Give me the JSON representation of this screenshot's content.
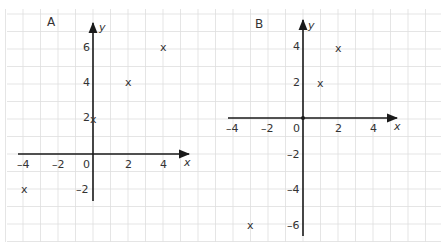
{
  "chart_data": [
    {
      "type": "scatter",
      "title": "A",
      "xlabel": "x",
      "ylabel": "y",
      "xlim": [
        -4,
        5
      ],
      "ylim": [
        -2.5,
        7
      ],
      "grid": true,
      "x_ticks": [
        "-4",
        "-2",
        "0",
        "2",
        "4"
      ],
      "y_ticks": [
        "6",
        "4",
        "2",
        "-2"
      ],
      "points": [
        {
          "x": 4,
          "y": 6
        },
        {
          "x": 2,
          "y": 4
        },
        {
          "x": 0,
          "y": 2
        },
        {
          "x": -4,
          "y": -2
        }
      ],
      "marker": "x"
    },
    {
      "type": "scatter",
      "title": "B",
      "xlabel": "x",
      "ylabel": "y",
      "xlim": [
        -4,
        5
      ],
      "ylim": [
        -6.5,
        5.5
      ],
      "grid": true,
      "x_ticks": [
        "-4",
        "-2",
        "0",
        "2",
        "4"
      ],
      "y_ticks": [
        "4",
        "2",
        "-2",
        "-4",
        "-6"
      ],
      "points": [
        {
          "x": 2,
          "y": 4
        },
        {
          "x": 1,
          "y": 2
        },
        {
          "x": 0,
          "y": 0
        },
        {
          "x": -3,
          "y": -6
        }
      ],
      "marker": "x"
    }
  ],
  "labels": {
    "graph_a_title": "A",
    "graph_b_title": "B",
    "x_axis": "x",
    "y_axis": "y",
    "marker_glyph": "x",
    "a_xticks": [
      "–4",
      "–2",
      "0",
      "2",
      "4"
    ],
    "a_yticks": [
      "6",
      "4",
      "2",
      "–2"
    ],
    "b_xticks": [
      "–4",
      "–2",
      "0",
      "2",
      "4"
    ],
    "b_yticks": [
      "4",
      "2",
      "–2",
      "–4",
      "–6"
    ]
  },
  "colors": {
    "grid": "#dedede",
    "axis": "#1a1a1a",
    "text": "#333333"
  }
}
